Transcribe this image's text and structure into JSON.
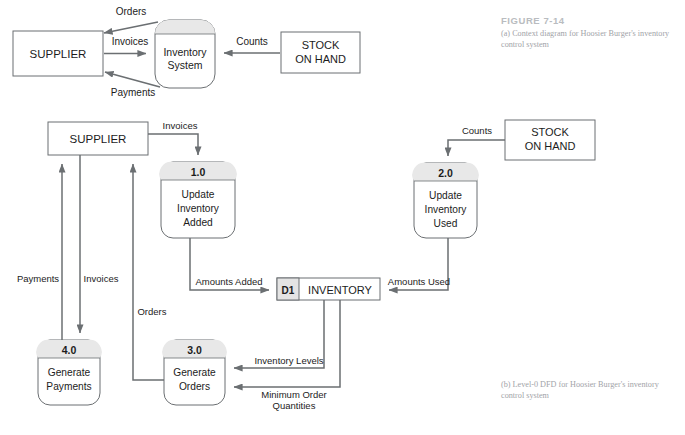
{
  "figure": {
    "number": "FIGURE 7-14",
    "caption_a": "(a) Context diagram for Hoosier Burger's inventory control system",
    "caption_b": "(b) Level-0 DFD for Hoosier Burger's inventory control system"
  },
  "colors": {
    "stroke": "#6b6f72",
    "shape_fill": "#ffffff",
    "process_band": "#e8e8e8",
    "store_id_fill": "#e4e4e4",
    "text": "#1c1c1c",
    "caption_title": "#b9bcc0",
    "caption_body": "#9fa3a8"
  },
  "context_diagram": {
    "entities": [
      {
        "id": "supplier",
        "label": "SUPPLIER"
      },
      {
        "id": "stock-on-hand",
        "label_line1": "STOCK",
        "label_line2": "ON HAND"
      }
    ],
    "process": {
      "id": "inventory-system",
      "label_line1": "Inventory",
      "label_line2": "System"
    },
    "flows": [
      {
        "id": "orders",
        "label": "Orders",
        "from": "inventory-system",
        "to": "supplier"
      },
      {
        "id": "invoices",
        "label": "Invoices",
        "from": "supplier",
        "to": "inventory-system"
      },
      {
        "id": "payments",
        "label": "Payments",
        "from": "inventory-system",
        "to": "supplier"
      },
      {
        "id": "counts",
        "label": "Counts",
        "from": "stock-on-hand",
        "to": "inventory-system"
      }
    ]
  },
  "level0_diagram": {
    "entities": [
      {
        "id": "supplier",
        "label": "SUPPLIER"
      },
      {
        "id": "stock-on-hand",
        "label_line1": "STOCK",
        "label_line2": "ON HAND"
      }
    ],
    "processes": [
      {
        "id": "p1",
        "number": "1.0",
        "line1": "Update",
        "line2": "Inventory",
        "line3": "Added"
      },
      {
        "id": "p2",
        "number": "2.0",
        "line1": "Update",
        "line2": "Inventory",
        "line3": "Used"
      },
      {
        "id": "p3",
        "number": "3.0",
        "line1": "Generate",
        "line2": "Orders",
        "line3": ""
      },
      {
        "id": "p4",
        "number": "4.0",
        "line1": "Generate",
        "line2": "Payments",
        "line3": ""
      }
    ],
    "data_store": {
      "id": "d1",
      "code": "D1",
      "label": "INVENTORY"
    },
    "flows": [
      {
        "id": "invoices-to-p1",
        "label": "Invoices",
        "from": "supplier",
        "to": "p1"
      },
      {
        "id": "counts-to-p2",
        "label": "Counts",
        "from": "stock-on-hand",
        "to": "p2"
      },
      {
        "id": "amounts-added",
        "label": "Amounts Added",
        "from": "p1",
        "to": "d1"
      },
      {
        "id": "amounts-used",
        "label": "Amounts Used",
        "from": "p2",
        "to": "d1"
      },
      {
        "id": "payments",
        "label": "Payments",
        "from": "p4",
        "to": "supplier"
      },
      {
        "id": "invoices-to-p4",
        "label": "Invoices",
        "from": "supplier",
        "to": "p4"
      },
      {
        "id": "orders",
        "label": "Orders",
        "from": "p3",
        "to": "supplier"
      },
      {
        "id": "inventory-levels",
        "label": "Inventory Levels",
        "from": "d1",
        "to": "p3"
      },
      {
        "id": "min-order-qty",
        "label_line1": "Minimum Order",
        "label_line2": "Quantities",
        "from": "d1",
        "to": "p3"
      }
    ]
  }
}
